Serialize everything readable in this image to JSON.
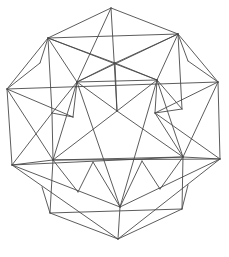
{
  "figure": {
    "type": "polyhedron-compound-line-drawing",
    "stroke_color": "#4a4a4a",
    "background": "#ffffff",
    "vertices": {
      "top": [
        111,
        8
      ],
      "ul": [
        48,
        38
      ],
      "ur": [
        178,
        34
      ],
      "l": [
        7,
        89
      ],
      "r": [
        218,
        82
      ],
      "il": [
        77,
        82
      ],
      "ir": [
        157,
        80
      ],
      "tc": [
        115,
        63
      ],
      "lsp": [
        40,
        63
      ],
      "rsp": [
        188,
        61
      ],
      "ml": [
        52,
        113
      ],
      "ml2": [
        73,
        117
      ],
      "mr": [
        155,
        113
      ],
      "mr2": [
        182,
        109
      ],
      "c": [
        117,
        111
      ],
      "ll": [
        12,
        165
      ],
      "lli": [
        53,
        160
      ],
      "rr": [
        220,
        159
      ],
      "rri": [
        183,
        157
      ],
      "b1": [
        93,
        162
      ],
      "b2": [
        142,
        161
      ],
      "b3": [
        78,
        192
      ],
      "b4": [
        160,
        189
      ],
      "bc": [
        120,
        207
      ],
      "bl": [
        50,
        213
      ],
      "br": [
        182,
        209
      ],
      "bls": [
        42,
        187
      ],
      "brs": [
        188,
        185
      ],
      "bottom": [
        118,
        239
      ]
    },
    "edges": [
      [
        "top",
        "ul"
      ],
      [
        "top",
        "ur"
      ],
      [
        "top",
        "c"
      ],
      [
        "top",
        "il"
      ],
      [
        "ul",
        "ur"
      ],
      [
        "ul",
        "il"
      ],
      [
        "ul",
        "ir"
      ],
      [
        "ul",
        "l"
      ],
      [
        "ul",
        "ml"
      ],
      [
        "ul",
        "tc"
      ],
      [
        "ul",
        "lsp"
      ],
      [
        "ur",
        "ir"
      ],
      [
        "ur",
        "il"
      ],
      [
        "ur",
        "r"
      ],
      [
        "ur",
        "mr2"
      ],
      [
        "ur",
        "tc"
      ],
      [
        "ur",
        "rsp"
      ],
      [
        "lsp",
        "l"
      ],
      [
        "rsp",
        "r"
      ],
      [
        "l",
        "r"
      ],
      [
        "l",
        "ll"
      ],
      [
        "l",
        "lli"
      ],
      [
        "l",
        "ml2"
      ],
      [
        "r",
        "rr"
      ],
      [
        "r",
        "rri"
      ],
      [
        "r",
        "mr"
      ],
      [
        "il",
        "ir"
      ],
      [
        "il",
        "c"
      ],
      [
        "il",
        "ml"
      ],
      [
        "il",
        "ml2"
      ],
      [
        "il",
        "lli"
      ],
      [
        "il",
        "bc"
      ],
      [
        "ir",
        "c"
      ],
      [
        "ir",
        "mr"
      ],
      [
        "ir",
        "mr2"
      ],
      [
        "ir",
        "rri"
      ],
      [
        "ir",
        "bc"
      ],
      [
        "tc",
        "c"
      ],
      [
        "tc",
        "il"
      ],
      [
        "tc",
        "ir"
      ],
      [
        "ml",
        "ml2"
      ],
      [
        "ml",
        "ll"
      ],
      [
        "ml",
        "lli"
      ],
      [
        "mr",
        "mr2"
      ],
      [
        "mr",
        "rr"
      ],
      [
        "mr",
        "rri"
      ],
      [
        "c",
        "lli"
      ],
      [
        "c",
        "rri"
      ],
      [
        "ll",
        "lli"
      ],
      [
        "ll",
        "rri"
      ],
      [
        "ll",
        "bc"
      ],
      [
        "ll",
        "bottom"
      ],
      [
        "rr",
        "rri"
      ],
      [
        "rr",
        "lli"
      ],
      [
        "rr",
        "bc"
      ],
      [
        "rr",
        "bottom"
      ],
      [
        "lli",
        "rri"
      ],
      [
        "lli",
        "bl"
      ],
      [
        "lli",
        "b3"
      ],
      [
        "rri",
        "br"
      ],
      [
        "rri",
        "b4"
      ],
      [
        "b1",
        "b3"
      ],
      [
        "b1",
        "bc"
      ],
      [
        "b2",
        "b4"
      ],
      [
        "b2",
        "bc"
      ],
      [
        "bls",
        "bl"
      ],
      [
        "brs",
        "br"
      ],
      [
        "bl",
        "br"
      ],
      [
        "bl",
        "bottom"
      ],
      [
        "br",
        "bottom"
      ],
      [
        "bc",
        "bottom"
      ]
    ]
  }
}
